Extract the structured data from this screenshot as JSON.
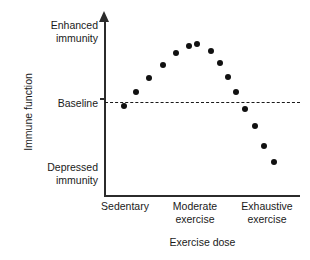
{
  "chart_data": {
    "type": "scatter",
    "title": "",
    "xlabel": "Exercise dose",
    "ylabel": "Immune function",
    "grid": false,
    "legend": null,
    "xlim": [
      0,
      100
    ],
    "ylim": [
      0,
      100
    ],
    "x_tick_labels": [
      "Sedentary",
      "Moderate\nexercise",
      "Exhaustive\nexercise"
    ],
    "x_tick_values": [
      10,
      47,
      83
    ],
    "y_tick_labels": [
      "Enhanced\nimmunity",
      "Baseline",
      "Depressed\nimmunity"
    ],
    "y_tick_values": [
      95,
      53,
      13
    ],
    "annotations": [
      {
        "name": "baseline-reference-line",
        "label": "Baseline",
        "style": "dashed",
        "orientation": "horizontal",
        "y": 53
      }
    ],
    "series": [
      {
        "name": "Immune function response",
        "marker": "filled-circle",
        "color": "#111111",
        "x": [
          10,
          16,
          23,
          30,
          37,
          44,
          48,
          55,
          60,
          64,
          68,
          73,
          78,
          83,
          88
        ],
        "y": [
          52,
          60,
          68,
          76,
          83,
          87,
          88,
          84,
          77,
          69,
          60,
          50,
          40,
          28,
          19
        ]
      }
    ]
  },
  "axes": {
    "y_arrow": "up-arrow",
    "y_labels": {
      "enhanced": "Enhanced\nimmunity",
      "baseline": "Baseline",
      "depressed": "Depressed\nimmunity"
    },
    "y_title": "Immune function",
    "x_labels": {
      "sedentary": "Sedentary",
      "moderate": "Moderate\nexercise",
      "exhaustive": "Exhaustive\nexercise"
    },
    "x_title": "Exercise dose"
  },
  "colors": {
    "marker": "#111111",
    "axis": "#2b2b2b",
    "text": "#1a1a1a",
    "background": "#ffffff"
  }
}
